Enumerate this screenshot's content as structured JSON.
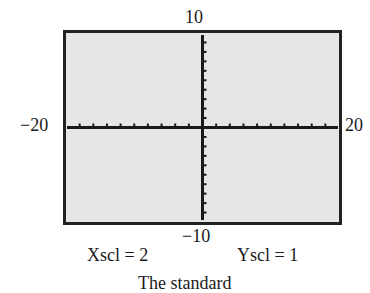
{
  "chart_data": {
    "type": "line",
    "title": "",
    "window": {
      "xmin": -20,
      "xmax": 20,
      "ymin": -10,
      "ymax": 10,
      "xscl": 2,
      "yscl": 1
    },
    "tick_labels": {
      "xmin": "−20",
      "xmax": "20",
      "ymin": "−10",
      "ymax": "10"
    },
    "scale_labels": {
      "xscl": "Xscl = 2",
      "yscl": "Yscl = 1"
    },
    "grid": false,
    "series": [],
    "colors": {
      "frame": "#222222",
      "screen": "#e6e6e6",
      "axes": "#1a1a1a"
    }
  },
  "caption_partial": "The standard"
}
